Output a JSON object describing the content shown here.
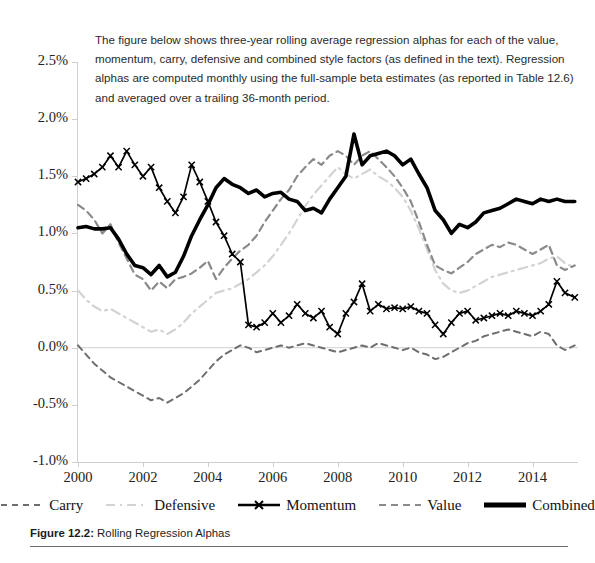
{
  "intro_text": "The figure below shows three-year rolling average regression alphas for each of the value, momentum, carry, defensive and combined style factors (as defined in the text). Regression alphas are computed monthly using the full-sample beta estimates (as reported in Table 12.6) and averaged over a trailing 36-month period.",
  "figure": {
    "number_label": "Figure 12.2:",
    "title": "Rolling Regression Alphas"
  },
  "legend": {
    "items": [
      {
        "label": "Carry",
        "key": "dashed-dark-gray",
        "color": "#6e6e6e"
      },
      {
        "label": "Defensive",
        "key": "dash-dot-light",
        "color": "#d3d3d3"
      },
      {
        "label": "Momentum",
        "key": "solid-x-marker",
        "color": "#000000"
      },
      {
        "label": "Value",
        "key": "dashed-medium-gray",
        "color": "#8a8a8a"
      },
      {
        "label": "Combined",
        "key": "thick-solid-black",
        "color": "#000000"
      }
    ]
  },
  "chart_data": {
    "type": "line",
    "title": "Rolling Regression Alphas",
    "xlabel": "",
    "ylabel": "",
    "xlim": [
      2000.0,
      2015.4
    ],
    "ylim": [
      -0.01,
      0.025
    ],
    "ytick_labels": [
      "2.5%",
      "2.0%",
      "1.5%",
      "1.0%",
      "0.5%",
      "0.0%",
      "-0.5%",
      "-1.0%"
    ],
    "ytick_values": [
      0.025,
      0.02,
      0.015,
      0.01,
      0.005,
      0.0,
      -0.005,
      -0.01
    ],
    "xtick_labels": [
      "2000",
      "2002",
      "2004",
      "2006",
      "2008",
      "2010",
      "2012",
      "2014"
    ],
    "xtick_values": [
      2000,
      2002,
      2004,
      2006,
      2008,
      2010,
      2012,
      2014
    ],
    "grid": false,
    "legend_position": "bottom",
    "x": [
      2000.0,
      2000.25,
      2000.5,
      2000.75,
      2001.0,
      2001.25,
      2001.5,
      2001.75,
      2002.0,
      2002.25,
      2002.5,
      2002.75,
      2003.0,
      2003.25,
      2003.5,
      2003.75,
      2004.0,
      2004.25,
      2004.5,
      2004.75,
      2005.0,
      2005.25,
      2005.5,
      2005.75,
      2006.0,
      2006.25,
      2006.5,
      2006.75,
      2007.0,
      2007.25,
      2007.5,
      2007.75,
      2008.0,
      2008.25,
      2008.5,
      2008.75,
      2009.0,
      2009.25,
      2009.5,
      2009.75,
      2010.0,
      2010.25,
      2010.5,
      2010.75,
      2011.0,
      2011.25,
      2011.5,
      2011.75,
      2012.0,
      2012.25,
      2012.5,
      2012.75,
      2013.0,
      2013.25,
      2013.5,
      2013.75,
      2014.0,
      2014.25,
      2014.5,
      2014.75,
      2015.0,
      2015.3
    ],
    "series": [
      {
        "name": "Momentum",
        "style": "solid-x-marker",
        "color": "#000000",
        "values": [
          0.0145,
          0.0148,
          0.0152,
          0.0158,
          0.0168,
          0.0158,
          0.0172,
          0.016,
          0.015,
          0.0158,
          0.014,
          0.0128,
          0.0118,
          0.0132,
          0.016,
          0.0145,
          0.0128,
          0.011,
          0.0098,
          0.0082,
          0.0075,
          0.002,
          0.0018,
          0.0022,
          0.003,
          0.0022,
          0.0028,
          0.0038,
          0.003,
          0.0026,
          0.0032,
          0.0018,
          0.0012,
          0.003,
          0.004,
          0.0056,
          0.0032,
          0.0038,
          0.0034,
          0.0035,
          0.0034,
          0.0036,
          0.0032,
          0.003,
          0.002,
          0.0012,
          0.0022,
          0.003,
          0.0032,
          0.0024,
          0.0026,
          0.0028,
          0.003,
          0.0028,
          0.0032,
          0.003,
          0.0028,
          0.0032,
          0.0038,
          0.0058,
          0.0048,
          0.0044
        ]
      },
      {
        "name": "Combined",
        "style": "thick-solid-black",
        "color": "#000000",
        "values": [
          0.0105,
          0.0106,
          0.0104,
          0.0104,
          0.0105,
          0.0095,
          0.0082,
          0.0072,
          0.007,
          0.0064,
          0.0072,
          0.0062,
          0.0066,
          0.008,
          0.0098,
          0.0112,
          0.0125,
          0.014,
          0.0148,
          0.0143,
          0.014,
          0.0135,
          0.0138,
          0.0132,
          0.0135,
          0.0136,
          0.013,
          0.0128,
          0.012,
          0.0122,
          0.0118,
          0.013,
          0.014,
          0.015,
          0.0187,
          0.016,
          0.0168,
          0.017,
          0.0172,
          0.0168,
          0.016,
          0.0165,
          0.0152,
          0.014,
          0.012,
          0.0112,
          0.01,
          0.0108,
          0.0105,
          0.011,
          0.0118,
          0.012,
          0.0122,
          0.0126,
          0.013,
          0.0128,
          0.0126,
          0.013,
          0.0128,
          0.013,
          0.0128,
          0.0128
        ]
      },
      {
        "name": "Value",
        "style": "dashed-medium-gray",
        "color": "#8a8a8a",
        "values": [
          0.0125,
          0.012,
          0.0112,
          0.01,
          0.0108,
          0.0092,
          0.0078,
          0.0064,
          0.006,
          0.005,
          0.0058,
          0.0052,
          0.006,
          0.0062,
          0.0065,
          0.007,
          0.0076,
          0.006,
          0.007,
          0.0078,
          0.0085,
          0.009,
          0.0098,
          0.011,
          0.012,
          0.013,
          0.0138,
          0.015,
          0.0158,
          0.0165,
          0.016,
          0.0168,
          0.0172,
          0.0168,
          0.016,
          0.0168,
          0.0172,
          0.0165,
          0.0158,
          0.015,
          0.014,
          0.0128,
          0.011,
          0.009,
          0.0072,
          0.0068,
          0.0065,
          0.007,
          0.0075,
          0.0082,
          0.0086,
          0.009,
          0.0088,
          0.0092,
          0.009,
          0.0086,
          0.0082,
          0.0086,
          0.009,
          0.0072,
          0.0068,
          0.0072
        ]
      },
      {
        "name": "Defensive",
        "style": "dash-dot-light",
        "color": "#d3d3d3",
        "values": [
          0.005,
          0.0042,
          0.0036,
          0.0032,
          0.0034,
          0.003,
          0.0026,
          0.0022,
          0.0018,
          0.0014,
          0.0016,
          0.0012,
          0.0016,
          0.0022,
          0.003,
          0.0036,
          0.0042,
          0.0048,
          0.005,
          0.0052,
          0.0056,
          0.006,
          0.0066,
          0.0072,
          0.008,
          0.009,
          0.01,
          0.0112,
          0.0124,
          0.0134,
          0.0142,
          0.015,
          0.0158,
          0.0152,
          0.0148,
          0.0152,
          0.0156,
          0.015,
          0.0146,
          0.014,
          0.0132,
          0.012,
          0.0104,
          0.0086,
          0.0068,
          0.0056,
          0.005,
          0.0048,
          0.005,
          0.0054,
          0.0058,
          0.0062,
          0.0064,
          0.0066,
          0.0068,
          0.007,
          0.0072,
          0.0074,
          0.0078,
          0.008,
          0.0074,
          0.007
        ]
      },
      {
        "name": "Carry",
        "style": "dashed-dark-gray",
        "color": "#6e6e6e",
        "values": [
          0.0002,
          -0.0006,
          -0.0014,
          -0.002,
          -0.0026,
          -0.003,
          -0.0034,
          -0.0038,
          -0.0042,
          -0.0046,
          -0.0044,
          -0.0048,
          -0.0044,
          -0.004,
          -0.0034,
          -0.0028,
          -0.002,
          -0.0012,
          -0.0006,
          -0.0002,
          0.0002,
          0.0,
          -0.0004,
          -0.0002,
          0.0,
          0.0002,
          0.0,
          0.0002,
          0.0004,
          0.0002,
          0.0,
          -0.0002,
          -0.0004,
          -0.0002,
          0.0,
          0.0002,
          0.0,
          0.0004,
          0.0002,
          0.0,
          -0.0002,
          0.0,
          -0.0004,
          -0.0006,
          -0.001,
          -0.0008,
          -0.0004,
          0.0,
          0.0004,
          0.0006,
          0.001,
          0.0012,
          0.0014,
          0.0016,
          0.0014,
          0.0012,
          0.001,
          0.0014,
          0.0012,
          0.0002,
          -0.0002,
          0.0002
        ]
      }
    ]
  }
}
